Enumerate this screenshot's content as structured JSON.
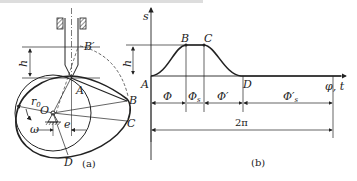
{
  "figure": {
    "panel_a": {
      "caption": "(a)",
      "labels": {
        "B_prime": "B′",
        "h": "h",
        "A": "A",
        "B": "B",
        "C": "C",
        "D": "D",
        "O": "O",
        "r0": "r",
        "r0_sub": "0",
        "omega": "ω",
        "e": "e"
      }
    },
    "panel_b": {
      "caption": "(b)",
      "axis": {
        "y_label": "s",
        "x_label": "φ, t"
      },
      "points": {
        "A": "A",
        "B": "B",
        "C": "C",
        "D": "D"
      },
      "h": "h",
      "intervals": [
        {
          "label": "Φ",
          "sub": ""
        },
        {
          "label": "Φ",
          "sub": "s"
        },
        {
          "label": "Φ′",
          "sub": ""
        },
        {
          "label": "Φ′",
          "sub": "s"
        }
      ],
      "total": "2π"
    },
    "colors": {
      "line": "#222222",
      "background": "#ffffff"
    }
  }
}
